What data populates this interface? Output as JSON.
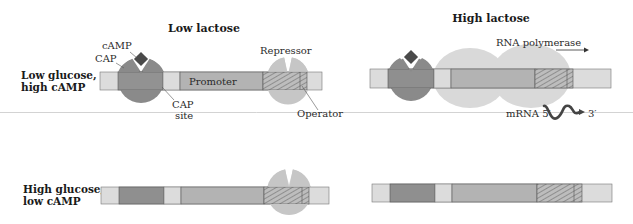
{
  "columns": {
    "left_title": "Low lactose",
    "right_title": "High lactose"
  },
  "rows": {
    "top": {
      "line1": "Low glucose,",
      "line2": "high cAMP"
    },
    "bottom": {
      "line1": "High glucose,",
      "line2": "low cAMP"
    }
  },
  "labels": {
    "camp": "cAMP",
    "cap": "CAP",
    "promoter": "Promoter",
    "cap_site_line1": "CAP",
    "cap_site_line2": "site",
    "repressor": "Repressor",
    "operator": "Operator",
    "rna_polymerase": "RNA polymerase",
    "mrna": "mRNA 5′",
    "three_prime": "3′"
  },
  "colors": {
    "dna_light": "#dcdcdc",
    "cap_site": "#8f8f8f",
    "promoter": "#b3b3b3",
    "cap_protein": "#8a8a8a",
    "camp": "#4a4a4a",
    "repressor": "#c6c6c6",
    "polymerase": "#d9d9d9",
    "outline": "#555555",
    "separator": "#c8c8c8"
  }
}
